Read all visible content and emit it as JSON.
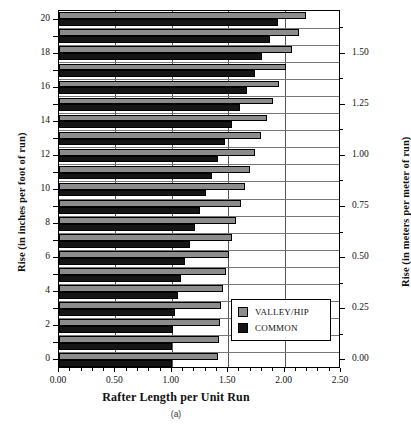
{
  "figure": {
    "caption": "(a)",
    "footnote": ""
  },
  "axes": {
    "x_title": "Rafter Length per Unit Run",
    "y_title_left": "Rise (in inches per foot of run)",
    "y_title_right": "Rise (in meters per meter of run)",
    "x_ticks": [
      "0.00",
      "0.50",
      "1.00",
      "1.50",
      "2.00",
      "2.50"
    ],
    "y_ticks_left": [
      "0",
      "2",
      "4",
      "6",
      "8",
      "10",
      "12",
      "14",
      "16",
      "18",
      "20"
    ],
    "y_ticks_right": [
      "0.00",
      "0.25",
      "0.50",
      "0.75",
      "1.00",
      "1.25",
      "1.50"
    ]
  },
  "legend": {
    "items": [
      {
        "label": "VALLEY/HIP",
        "color": "#8c8c8c"
      },
      {
        "label": "COMMON",
        "color": "#151515"
      }
    ]
  },
  "chart_data": {
    "type": "bar",
    "orientation": "horizontal",
    "title": "",
    "xlabel": "Rafter Length per Unit Run",
    "ylabel": "Rise (in inches per foot of run)",
    "ylabel_secondary": "Rise (in meters per meter of run)",
    "xlim": [
      0.0,
      2.5
    ],
    "ylim": [
      0,
      20.5
    ],
    "y_secondary_lim": [
      0.0,
      1.7083
    ],
    "grid": true,
    "legend_position": "inside-lower-right",
    "categories": [
      0,
      1,
      2,
      3,
      4,
      5,
      6,
      7,
      8,
      9,
      10,
      11,
      12,
      13,
      14,
      15,
      16,
      17,
      18,
      19,
      20
    ],
    "series": [
      {
        "name": "VALLEY/HIP",
        "color": "#8c8c8c",
        "values": [
          1.414,
          1.417,
          1.425,
          1.439,
          1.457,
          1.479,
          1.506,
          1.537,
          1.571,
          1.61,
          1.651,
          1.695,
          1.742,
          1.791,
          1.842,
          1.896,
          1.951,
          2.008,
          2.066,
          2.126,
          2.186
        ]
      },
      {
        "name": "COMMON",
        "color": "#151515",
        "values": [
          1.0,
          1.003,
          1.014,
          1.031,
          1.054,
          1.083,
          1.118,
          1.158,
          1.202,
          1.25,
          1.302,
          1.357,
          1.414,
          1.474,
          1.537,
          1.601,
          1.667,
          1.734,
          1.803,
          1.873,
          1.944
        ]
      }
    ]
  }
}
